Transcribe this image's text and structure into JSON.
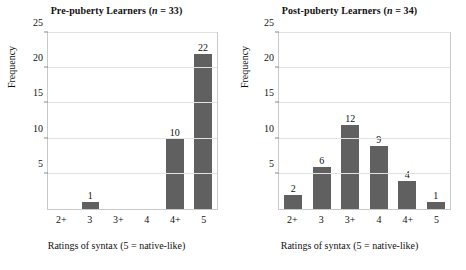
{
  "figure": {
    "background": "#ffffff",
    "bar_color": "#606060",
    "grid_color": "#e2e2e2",
    "axis_color": "#c9c9c9"
  },
  "chart_data": [
    {
      "type": "bar",
      "title_prefix": "Pre-puberty Learners (",
      "title_var": "n",
      "title_suffix": " = 33)",
      "title": "Pre-puberty Learners (n = 33)",
      "n": 33,
      "categories": [
        "2+",
        "3",
        "3+",
        "4",
        "4+",
        "5"
      ],
      "values": [
        0,
        1,
        0,
        0,
        10,
        22
      ],
      "labels": [
        "",
        "1",
        "",
        "",
        "10",
        "22"
      ],
      "xlabel": "Ratings of syntax (5 = native-like)",
      "ylabel": "Frequency",
      "ylim": [
        0,
        25
      ],
      "yticks": [
        5,
        10,
        15,
        20,
        25
      ],
      "grid": true,
      "legend": "none"
    },
    {
      "type": "bar",
      "title_prefix": "Post-puberty Learners (",
      "title_var": "n",
      "title_suffix": " = 34)",
      "title": "Post-puberty Learners (n = 34)",
      "n": 34,
      "categories": [
        "2+",
        "3",
        "3+",
        "4",
        "4+",
        "5"
      ],
      "values": [
        2,
        6,
        12,
        9,
        4,
        1
      ],
      "labels": [
        "2",
        "6",
        "12",
        "9",
        "4",
        "1"
      ],
      "xlabel": "Ratings of syntax (5 = native-like)",
      "ylabel": "Frequency",
      "ylim": [
        0,
        25
      ],
      "yticks": [
        5,
        10,
        15,
        20,
        25
      ],
      "grid": true,
      "legend": "none"
    }
  ]
}
